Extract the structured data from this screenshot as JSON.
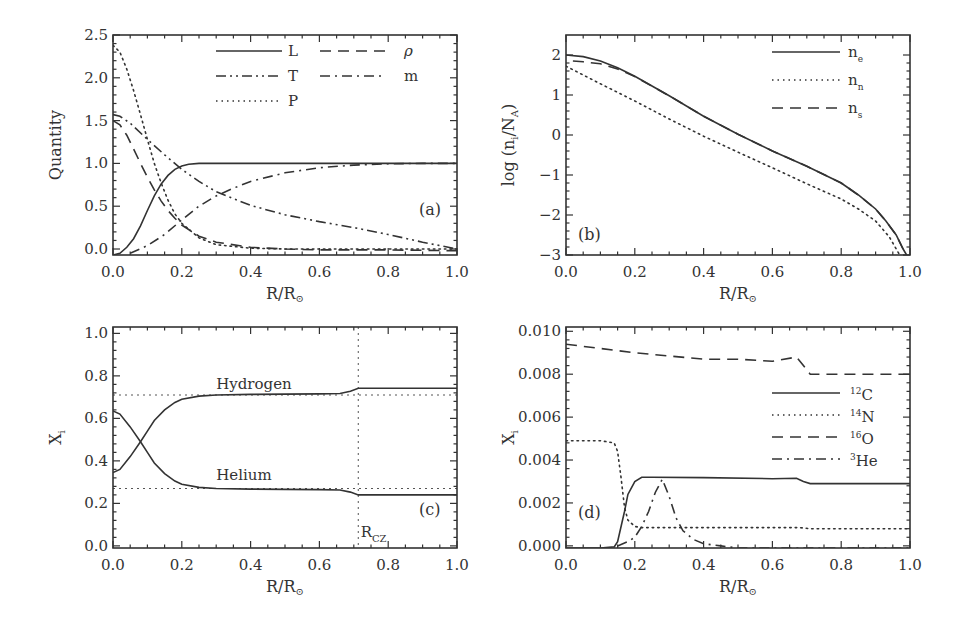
{
  "figure": {
    "panels": [
      "a",
      "b",
      "c",
      "d"
    ]
  },
  "chart_data": [
    {
      "id": "a",
      "type": "line",
      "tag": "(a)",
      "xlabel": "R/R⊙",
      "ylabel": "Quantity",
      "xlim": [
        0.0,
        1.0
      ],
      "ylim": [
        -0.07,
        2.5
      ],
      "xticks": [
        "0.0",
        "0.2",
        "0.4",
        "0.6",
        "0.8",
        "1.0"
      ],
      "yticks": [
        "0.0",
        "0.5",
        "1.0",
        "1.5",
        "2.0",
        "2.5"
      ],
      "legend": [
        {
          "label": "L",
          "style": "solid"
        },
        {
          "label": "ρ",
          "style": "dashed"
        },
        {
          "label": "T",
          "style": "dash-dot-dot"
        },
        {
          "label": "m",
          "style": "dash-dot"
        },
        {
          "label": "P",
          "style": "dotted"
        }
      ],
      "series": [
        {
          "name": "L",
          "style": "solid",
          "x": [
            0,
            0.02,
            0.04,
            0.06,
            0.08,
            0.1,
            0.12,
            0.14,
            0.16,
            0.18,
            0.2,
            0.22,
            0.25,
            0.3,
            0.4,
            0.6,
            0.8,
            1.0
          ],
          "y": [
            -0.07,
            -0.05,
            0.02,
            0.12,
            0.27,
            0.45,
            0.62,
            0.76,
            0.86,
            0.93,
            0.97,
            0.99,
            1.0,
            1.0,
            1.0,
            1.0,
            1.0,
            1.0
          ]
        },
        {
          "name": "ρ",
          "style": "dashed",
          "x": [
            0,
            0.02,
            0.04,
            0.06,
            0.08,
            0.1,
            0.12,
            0.14,
            0.16,
            0.18,
            0.2,
            0.25,
            0.3,
            0.4,
            0.5,
            0.6,
            0.8,
            1.0
          ],
          "y": [
            1.5,
            1.45,
            1.33,
            1.17,
            1.0,
            0.84,
            0.69,
            0.56,
            0.45,
            0.36,
            0.28,
            0.15,
            0.08,
            0.02,
            0.0,
            -0.01,
            -0.01,
            -0.02
          ]
        },
        {
          "name": "T",
          "style": "dash-dot-dot",
          "x": [
            0,
            0.02,
            0.05,
            0.1,
            0.15,
            0.2,
            0.25,
            0.3,
            0.4,
            0.5,
            0.6,
            0.7,
            0.8,
            0.9,
            0.95,
            1.0
          ],
          "y": [
            1.57,
            1.55,
            1.47,
            1.28,
            1.1,
            0.93,
            0.79,
            0.67,
            0.51,
            0.4,
            0.32,
            0.25,
            0.17,
            0.08,
            0.04,
            0.0
          ]
        },
        {
          "name": "m",
          "style": "dash-dot",
          "x": [
            0.05,
            0.1,
            0.15,
            0.2,
            0.25,
            0.3,
            0.35,
            0.4,
            0.5,
            0.6,
            0.7,
            0.8,
            0.9,
            1.0
          ],
          "y": [
            -0.05,
            0.04,
            0.17,
            0.34,
            0.5,
            0.62,
            0.71,
            0.79,
            0.89,
            0.95,
            0.98,
            0.995,
            1.0,
            1.0
          ]
        },
        {
          "name": "P",
          "style": "dotted",
          "x": [
            0,
            0.02,
            0.04,
            0.06,
            0.08,
            0.1,
            0.12,
            0.14,
            0.16,
            0.18,
            0.2,
            0.25,
            0.3,
            0.4,
            0.5,
            1.0
          ],
          "y": [
            2.38,
            2.3,
            2.1,
            1.85,
            1.57,
            1.28,
            1.0,
            0.77,
            0.57,
            0.41,
            0.3,
            0.13,
            0.05,
            0.01,
            0.0,
            0.0
          ]
        }
      ]
    },
    {
      "id": "b",
      "type": "line",
      "tag": "(b)",
      "xlabel": "R/R⊙",
      "ylabel": "log (n_i/N_A)",
      "xlim": [
        0.0,
        1.0
      ],
      "ylim": [
        -3.0,
        2.5
      ],
      "xticks": [
        "0.0",
        "0.2",
        "0.4",
        "0.6",
        "0.8",
        "1.0"
      ],
      "yticks": [
        "-3",
        "-2",
        "-1",
        "0",
        "1",
        "2"
      ],
      "legend": [
        {
          "label": "n",
          "sub": "e",
          "style": "solid"
        },
        {
          "label": "n",
          "sub": "n",
          "style": "dotted"
        },
        {
          "label": "n",
          "sub": "s",
          "style": "dashed"
        }
      ],
      "series": [
        {
          "name": "n_e",
          "style": "solid",
          "x": [
            0,
            0.05,
            0.1,
            0.15,
            0.2,
            0.3,
            0.4,
            0.5,
            0.6,
            0.7,
            0.8,
            0.85,
            0.9,
            0.93,
            0.96,
            0.98,
            0.99
          ],
          "y": [
            2.0,
            1.96,
            1.85,
            1.68,
            1.47,
            0.98,
            0.47,
            0.02,
            -0.4,
            -0.78,
            -1.2,
            -1.5,
            -1.85,
            -2.15,
            -2.5,
            -2.85,
            -3.0
          ]
        },
        {
          "name": "n_n",
          "style": "dotted",
          "x": [
            0,
            0.05,
            0.1,
            0.2,
            0.3,
            0.4,
            0.5,
            0.6,
            0.7,
            0.8,
            0.85,
            0.9,
            0.94,
            0.97
          ],
          "y": [
            1.72,
            1.5,
            1.28,
            0.85,
            0.4,
            -0.03,
            -0.43,
            -0.82,
            -1.22,
            -1.6,
            -1.85,
            -2.15,
            -2.55,
            -3.0
          ]
        },
        {
          "name": "n_s",
          "style": "dashed",
          "x": [
            0.02,
            0.05,
            0.1,
            0.15,
            0.2,
            0.3,
            0.4,
            0.5,
            0.6,
            0.7,
            0.8,
            0.85,
            0.9,
            0.93,
            0.96,
            0.98
          ],
          "y": [
            1.85,
            1.83,
            1.78,
            1.65,
            1.46,
            0.98,
            0.47,
            0.02,
            -0.4,
            -0.78,
            -1.2,
            -1.5,
            -1.85,
            -2.15,
            -2.5,
            -2.85
          ]
        }
      ]
    },
    {
      "id": "c",
      "type": "line",
      "tag": "(c)",
      "xlabel": "R/R⊙",
      "ylabel": "X_i",
      "xlim": [
        0.0,
        1.0
      ],
      "ylim": [
        -0.01,
        1.03
      ],
      "xticks": [
        "0.0",
        "0.2",
        "0.4",
        "0.6",
        "0.8",
        "1.0"
      ],
      "yticks": [
        "0.0",
        "0.2",
        "0.4",
        "0.6",
        "0.8",
        "1.0"
      ],
      "annotations": [
        {
          "text": "Hydrogen",
          "x": 0.3,
          "y": 0.74
        },
        {
          "text": "Helium",
          "x": 0.3,
          "y": 0.31
        },
        {
          "text": "R",
          "sub": "CZ",
          "x": 0.72,
          "y": 0.04
        }
      ],
      "reference_lines": {
        "h": [
          0.71,
          0.27
        ],
        "v": [
          0.713
        ]
      },
      "series": [
        {
          "name": "Hydrogen",
          "style": "solid",
          "x": [
            0,
            0.02,
            0.05,
            0.08,
            0.1,
            0.12,
            0.15,
            0.18,
            0.2,
            0.25,
            0.3,
            0.4,
            0.5,
            0.6,
            0.66,
            0.69,
            0.713,
            0.8,
            1.0
          ],
          "y": [
            0.345,
            0.36,
            0.42,
            0.49,
            0.54,
            0.59,
            0.64,
            0.675,
            0.69,
            0.705,
            0.71,
            0.713,
            0.714,
            0.715,
            0.717,
            0.728,
            0.742,
            0.742,
            0.742
          ]
        },
        {
          "name": "Helium",
          "style": "solid",
          "x": [
            0,
            0.02,
            0.05,
            0.08,
            0.1,
            0.12,
            0.15,
            0.18,
            0.2,
            0.25,
            0.3,
            0.4,
            0.5,
            0.6,
            0.66,
            0.69,
            0.713,
            0.8,
            1.0
          ],
          "y": [
            0.635,
            0.62,
            0.56,
            0.49,
            0.44,
            0.39,
            0.34,
            0.305,
            0.29,
            0.275,
            0.27,
            0.267,
            0.266,
            0.265,
            0.263,
            0.253,
            0.24,
            0.24,
            0.24
          ]
        }
      ]
    },
    {
      "id": "d",
      "type": "line",
      "tag": "(d)",
      "xlabel": "R/R⊙",
      "ylabel": "X_i",
      "xlim": [
        0.0,
        1.0
      ],
      "ylim": [
        -0.0001,
        0.0102
      ],
      "xticks": [
        "0.0",
        "0.2",
        "0.4",
        "0.6",
        "0.8",
        "1.0"
      ],
      "yticks": [
        "0.000",
        "0.002",
        "0.004",
        "0.006",
        "0.008",
        "0.010"
      ],
      "legend": [
        {
          "label": "C",
          "sup": "12",
          "style": "solid"
        },
        {
          "label": "N",
          "sup": "14",
          "style": "dotted"
        },
        {
          "label": "O",
          "sup": "16",
          "style": "dashed"
        },
        {
          "label": "He",
          "sup": "3",
          "style": "dash-dot"
        }
      ],
      "series": [
        {
          "name": "12C",
          "style": "solid",
          "x": [
            0,
            0.1,
            0.14,
            0.15,
            0.17,
            0.18,
            0.2,
            0.22,
            0.25,
            0.4,
            0.6,
            0.67,
            0.69,
            0.71,
            0.8,
            1.0
          ],
          "y": [
            -0.0001,
            -0.0001,
            -5e-05,
            0.0002,
            0.0016,
            0.0024,
            0.003,
            0.0032,
            0.0032,
            0.00318,
            0.00313,
            0.00315,
            0.003,
            0.0029,
            0.0029,
            0.0029
          ]
        },
        {
          "name": "14N",
          "style": "dotted",
          "x": [
            0,
            0.1,
            0.14,
            0.15,
            0.16,
            0.17,
            0.18,
            0.2,
            0.22,
            0.3,
            0.6,
            0.68,
            0.71,
            0.8,
            1.0
          ],
          "y": [
            0.0049,
            0.0049,
            0.0048,
            0.0044,
            0.0032,
            0.0018,
            0.0012,
            0.0009,
            0.00085,
            0.00085,
            0.00085,
            0.00085,
            0.0008,
            0.0008,
            0.0008
          ]
        },
        {
          "name": "16O",
          "style": "dashed",
          "x": [
            0,
            0.1,
            0.2,
            0.3,
            0.4,
            0.5,
            0.6,
            0.67,
            0.69,
            0.71,
            0.8,
            1.0
          ],
          "y": [
            0.0094,
            0.0092,
            0.009,
            0.00885,
            0.0087,
            0.0087,
            0.0086,
            0.0088,
            0.0084,
            0.008,
            0.008,
            0.008
          ]
        },
        {
          "name": "3He",
          "style": "dash-dot",
          "x": [
            0.15,
            0.18,
            0.2,
            0.22,
            0.24,
            0.26,
            0.28,
            0.3,
            0.32,
            0.34,
            0.37,
            0.4,
            0.45,
            0.5,
            0.7,
            1.0
          ],
          "y": [
            0.0,
            0.0002,
            0.0004,
            0.0009,
            0.0016,
            0.0025,
            0.0031,
            0.0023,
            0.0013,
            0.0007,
            0.0003,
            0.0001,
            0.0,
            -0.0001,
            -0.0001,
            -0.0001
          ]
        }
      ]
    }
  ]
}
